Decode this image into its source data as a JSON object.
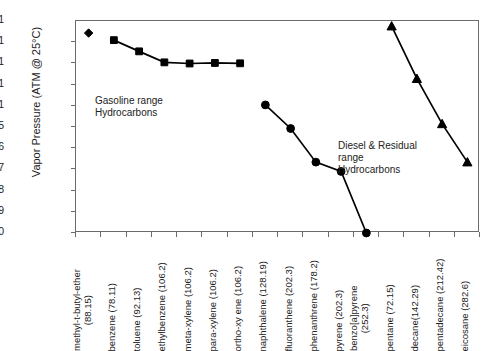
{
  "chart_data": {
    "type": "line",
    "title": "",
    "xlabel": "",
    "ylabel": "Vapor Pressure (ATM @ 25°C)",
    "yscale": "log",
    "ylim": [
      1e-10,
      1
    ],
    "grid": false,
    "legend": "none",
    "ytick_labels": [
      "1",
      "0.1",
      "0.01",
      "0.001",
      "0.0001",
      "1E-05",
      "1E-06",
      "1E-07",
      "1E-08",
      "1E-09",
      "1E-10"
    ],
    "ytick_values": [
      1,
      0.1,
      0.01,
      0.001,
      0.0001,
      1e-05,
      1e-06,
      1e-07,
      1e-08,
      1e-09,
      1e-10
    ],
    "categories": [
      "methyl-t-butyl-ether (88.15)",
      "benzene (78.11)",
      "toluene (92.13)",
      "ethylbenzene (106.2)",
      "meta-xylene (106.2)",
      "para-xylene (106.2)",
      "ortho-xy ene (106.2)",
      "naphthalene (128.19)",
      "fluoranthene (202.3)",
      "phenanthrene (178.2)",
      "pyrene (202.3)",
      "benzo[a]pyrene (252.3)",
      "pentane (72.15)",
      "decane(142.29)",
      "pentadecane (212.42)",
      "eicosane (282.6)"
    ],
    "category_labels": [
      {
        "lines": [
          "methyl-t-butyl-ether",
          "(88.15)"
        ],
        "two_line": true
      },
      {
        "lines": [
          "benzene (78.11)"
        ],
        "two_line": false
      },
      {
        "lines": [
          "toluene (92.13)"
        ],
        "two_line": false
      },
      {
        "lines": [
          "ethylbenzene (106.2)"
        ],
        "two_line": false
      },
      {
        "lines": [
          "meta-xylene (106.2)"
        ],
        "two_line": false
      },
      {
        "lines": [
          "para-xylene (106.2)"
        ],
        "two_line": false
      },
      {
        "lines": [
          "ortho-xy ene (106.2)"
        ],
        "two_line": false
      },
      {
        "lines": [
          "naphthalene (128.19)"
        ],
        "two_line": false
      },
      {
        "lines": [
          "fluoranthene (202.3)"
        ],
        "two_line": false
      },
      {
        "lines": [
          "phenanthrene (178.2)"
        ],
        "two_line": false
      },
      {
        "lines": [
          "pyrene (202.3)"
        ],
        "two_line": false
      },
      {
        "lines": [
          "benzo[a]pyrene",
          "(252.3)"
        ],
        "two_line": true
      },
      {
        "lines": [
          "pentane (72.15)"
        ],
        "two_line": false
      },
      {
        "lines": [
          "decane(142.29)"
        ],
        "two_line": false
      },
      {
        "lines": [
          "pentadecane (212.42)"
        ],
        "two_line": false
      },
      {
        "lines": [
          "eicosane (282.6)"
        ],
        "two_line": false
      }
    ],
    "series": [
      {
        "name": "MTBE",
        "marker": "diamond",
        "color": "#000000",
        "points": [
          {
            "x": 0,
            "y": 0.27
          }
        ]
      },
      {
        "name": "Gasoline range aromatics",
        "marker": "square",
        "color": "#000000",
        "points": [
          {
            "x": 1,
            "y": 0.125
          },
          {
            "x": 2,
            "y": 0.037
          },
          {
            "x": 3,
            "y": 0.0112
          },
          {
            "x": 4,
            "y": 0.0099
          },
          {
            "x": 5,
            "y": 0.0105
          },
          {
            "x": 6,
            "y": 0.0101
          }
        ]
      },
      {
        "name": "PAH / Diesel & Residual range",
        "marker": "circle",
        "color": "#000000",
        "points": [
          {
            "x": 7,
            "y": 0.00011
          },
          {
            "x": 8,
            "y": 8.5e-06
          },
          {
            "x": 9,
            "y": 2.2e-07
          },
          {
            "x": 10,
            "y": 8e-08
          },
          {
            "x": 11,
            "y": 1e-10
          }
        ]
      },
      {
        "name": "Alkanes",
        "marker": "triangle",
        "color": "#000000",
        "points": [
          {
            "x": 12,
            "y": 0.57
          },
          {
            "x": 13,
            "y": 0.0019
          },
          {
            "x": 14,
            "y": 1.4e-05
          },
          {
            "x": 15,
            "y": 2.2e-07
          }
        ]
      }
    ],
    "annotations": [
      {
        "id": "gasoline",
        "lines": [
          "Gasoline range",
          "Hydrocarbons"
        ]
      },
      {
        "id": "diesel",
        "lines": [
          "Diesel & Residual",
          "range",
          "Hydrocarbons"
        ]
      }
    ]
  }
}
